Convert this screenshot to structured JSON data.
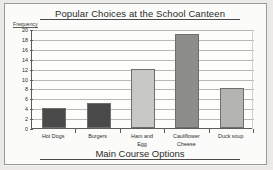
{
  "chart_data": {
    "type": "bar",
    "title": "Popular Choices at the School Canteen",
    "xlabel": "Main Course Options",
    "ylabel": "Frequency",
    "categories": [
      "Hot Dogs",
      "Burgers",
      "Ham and Egg",
      "Cauliflower Cheese",
      "Duck soup"
    ],
    "category_lines": [
      [
        "Hot Dogs"
      ],
      [
        "Burgers"
      ],
      [
        "Ham and",
        "Egg"
      ],
      [
        "Cauliflower",
        "Cheese"
      ],
      [
        "Duck soup"
      ]
    ],
    "values": [
      4,
      5,
      12,
      19,
      8
    ],
    "bar_colors": [
      "#4a4a4a",
      "#4a4a4a",
      "#c8c8c6",
      "#8d8d8b",
      "#b4b4b2"
    ],
    "ylim": [
      0,
      20
    ],
    "ytick_labels": [
      "20",
      "18",
      "16",
      "14",
      "12",
      "10",
      "8",
      "6",
      "4",
      "2",
      "0"
    ],
    "ytick_values": [
      20,
      18,
      16,
      14,
      12,
      10,
      8,
      6,
      4,
      2,
      0
    ],
    "grid": true,
    "legend": "none",
    "axis_color": "#5d5d5a",
    "grid_color": "#b9b9b4"
  }
}
